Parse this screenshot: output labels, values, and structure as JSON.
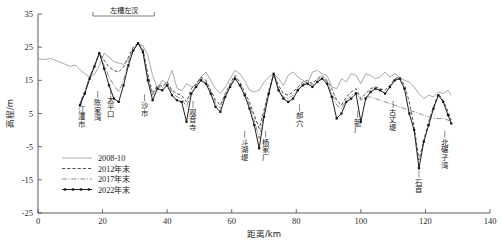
{
  "chart_data": {
    "type": "line",
    "title": "",
    "xlabel": "距离/km",
    "ylabel": "高程/m",
    "xlim": [
      0,
      140
    ],
    "ylim": [
      -25,
      35
    ],
    "xticks": [
      0,
      20,
      40,
      60,
      80,
      100,
      120,
      140
    ],
    "yticks": [
      -25,
      -15,
      -5,
      5,
      15,
      25,
      35
    ],
    "grid": false,
    "legend_position": "lower-left",
    "annotation": {
      "label": "左槽左汊",
      "x_start": 17,
      "x_end": 36
    },
    "site_labels": [
      {
        "name": "江澧市",
        "x": 13.5,
        "y": 8.0
      },
      {
        "name": "陈家湾",
        "x": 18.5,
        "y": 10.0
      },
      {
        "name": "太平口",
        "x": 22.5,
        "y": 11.0
      },
      {
        "name": "沙市",
        "x": 33.0,
        "y": 9.0
      },
      {
        "name": "观音寺",
        "x": 48.0,
        "y": 7.0
      },
      {
        "name": "斗湖堤",
        "x": 64.0,
        "y": -2.0
      },
      {
        "name": "杨家厂",
        "x": 70.5,
        "y": -2.0
      },
      {
        "name": "郝穴",
        "x": 81.0,
        "y": 6.0
      },
      {
        "name": "新厂",
        "x": 99.0,
        "y": 4.0
      },
      {
        "name": "古丈堤",
        "x": 110.0,
        "y": 7.0
      },
      {
        "name": "石首",
        "x": 118.0,
        "y": -14.0
      },
      {
        "name": "北碾子湾",
        "x": 126.0,
        "y": -2.0
      }
    ],
    "series": [
      {
        "name": "2008-10",
        "style": "solid-gray",
        "color": "#9a9a9a",
        "x": [
          0,
          2,
          4,
          6,
          8,
          10,
          11.5,
          13,
          14.5,
          16,
          17.5,
          19,
          20.5,
          22,
          23.5,
          25,
          26.5,
          28,
          29.5,
          31,
          32.5,
          34,
          35.5,
          37,
          38.5,
          40,
          41.5,
          43,
          44.5,
          46,
          47.5,
          49,
          50.5,
          52,
          53.5,
          55,
          56.5,
          58,
          59.5,
          61,
          62.5,
          64,
          65.5,
          67,
          68.5,
          70,
          71.5,
          73,
          74.5,
          76,
          77.5,
          79,
          80.5,
          82,
          83.5,
          85,
          86.5,
          88,
          89.5,
          91,
          92.5,
          94,
          95.5,
          97,
          98.5,
          100,
          101.5,
          103,
          104.5,
          106,
          107.5,
          109,
          110.5,
          112,
          113.5,
          115,
          116.5,
          118,
          119.5,
          121,
          122.5,
          124,
          125.5,
          127,
          128
        ],
        "values": [
          21.5,
          21.3,
          21.6,
          20.8,
          20.0,
          19.2,
          19.6,
          18.2,
          17.0,
          16.0,
          16.8,
          19.5,
          23.2,
          22.0,
          20.6,
          20.2,
          19.8,
          21.5,
          24.0,
          26.0,
          25.5,
          22.5,
          16.5,
          12.5,
          15.0,
          14.2,
          18.0,
          12.8,
          11.8,
          14.0,
          13.0,
          13.5,
          16.0,
          17.5,
          15.0,
          12.5,
          11.0,
          13.0,
          15.5,
          18.0,
          17.0,
          15.0,
          12.0,
          11.5,
          12.0,
          14.5,
          16.0,
          17.0,
          15.5,
          13.5,
          16.5,
          17.5,
          16.0,
          15.0,
          14.0,
          17.5,
          18.0,
          17.0,
          16.5,
          13.0,
          12.5,
          15.5,
          14.5,
          17.0,
          16.5,
          14.0,
          17.0,
          16.5,
          15.5,
          16.0,
          17.5,
          16.0,
          17.0,
          16.0,
          15.0,
          14.5,
          13.0,
          11.0,
          9.5,
          10.5,
          10.0,
          11.5,
          11.0,
          12.0,
          10.5
        ]
      },
      {
        "name": "2012年末",
        "style": "dashed",
        "color": "#333333",
        "x": [
          13,
          14.5,
          16,
          17.5,
          19,
          20.5,
          22,
          23.5,
          25,
          26.5,
          28,
          29.5,
          31,
          32.5,
          34,
          35.5,
          37,
          38.5,
          40,
          41.5,
          43,
          44.5,
          46,
          47.5,
          49,
          50.5,
          52,
          53.5,
          55,
          56.5,
          58,
          59.5,
          61,
          62.5,
          64,
          65.5,
          67,
          68.5,
          70,
          71.5,
          73,
          74.5,
          76,
          77.5,
          79,
          80.5,
          82,
          83.5,
          85,
          86.5,
          88,
          89.5,
          91,
          92.5,
          94,
          95.5,
          97,
          98.5,
          100,
          101.5,
          103,
          104.5,
          106,
          107.5,
          109,
          110.5,
          112,
          113.5,
          115,
          116.5,
          118,
          119.5,
          121,
          122.5,
          124,
          125.5,
          127,
          128
        ],
        "values": [
          8.0,
          11.5,
          16.0,
          19.5,
          23.3,
          21.0,
          19.0,
          18.0,
          17.5,
          19.0,
          22.0,
          25.0,
          26.2,
          24.5,
          17.0,
          11.0,
          13.5,
          13.2,
          14.5,
          12.0,
          11.0,
          10.5,
          8.5,
          12.5,
          14.0,
          16.0,
          15.0,
          12.0,
          9.0,
          7.5,
          11.0,
          14.0,
          16.5,
          14.5,
          11.5,
          8.5,
          4.5,
          0.5,
          6.0,
          12.0,
          17.0,
          13.5,
          11.0,
          10.5,
          11.5,
          13.0,
          14.5,
          15.0,
          14.0,
          15.5,
          16.5,
          15.0,
          12.5,
          9.0,
          7.5,
          10.0,
          11.5,
          12.5,
          9.5,
          11.0,
          12.5,
          13.0,
          12.5,
          12.0,
          13.5,
          15.5,
          16.0,
          13.5,
          8.5,
          1.0,
          -9.0,
          -3.0,
          2.5,
          7.0,
          11.0,
          9.0,
          5.5,
          3.0
        ]
      },
      {
        "name": "2017年末",
        "style": "dash-dot",
        "color": "#777777",
        "x": [
          13,
          14.5,
          16,
          17.5,
          19,
          20.5,
          22,
          23.5,
          25,
          26.5,
          28,
          29.5,
          31,
          32.5,
          34,
          35.5,
          37,
          38.5,
          40,
          41.5,
          43,
          44.5,
          46,
          47.5,
          49,
          50.5,
          52,
          53.5,
          55,
          56.5,
          58,
          59.5,
          61,
          62.5,
          64,
          65.5,
          67,
          68.5,
          70,
          71.5,
          73,
          74.5,
          76,
          77.5,
          79,
          80.5,
          82,
          83.5,
          85,
          86.5,
          88,
          89.5,
          91,
          92.5,
          94,
          95.5,
          97,
          98.5,
          100,
          101.5,
          103,
          104.5,
          106,
          107.5,
          109,
          110.5,
          112,
          113.5,
          115,
          116.5,
          118,
          119.5,
          121,
          122.5,
          124,
          125.5,
          127,
          128
        ],
        "values": [
          8.0,
          11.5,
          16.0,
          19.5,
          23.2,
          19.5,
          16.0,
          13.5,
          11.5,
          15.0,
          20.5,
          24.5,
          26.0,
          24.0,
          16.0,
          10.5,
          13.0,
          12.8,
          14.0,
          11.5,
          10.0,
          9.5,
          7.0,
          11.5,
          13.5,
          15.5,
          14.5,
          11.5,
          8.0,
          6.5,
          10.5,
          13.5,
          16.0,
          14.0,
          11.0,
          7.5,
          3.0,
          -2.5,
          5.0,
          11.5,
          17.0,
          12.5,
          10.0,
          9.5,
          10.5,
          12.5,
          14.0,
          14.5,
          13.5,
          15.0,
          16.0,
          14.5,
          11.0,
          7.5,
          6.5,
          9.0,
          10.5,
          11.5,
          9.0,
          10.0,
          10.0,
          9.5,
          9.0,
          8.5,
          8.0,
          7.5,
          7.0,
          6.5,
          6.0,
          5.5,
          5.0,
          4.5,
          4.0,
          3.5,
          3.5,
          3.5,
          3.0,
          2.5
        ]
      },
      {
        "name": "2022年末",
        "style": "solid-marker",
        "color": "#111111",
        "x": [
          13,
          14.5,
          16,
          17.5,
          19,
          20.5,
          22,
          23.5,
          25,
          26.5,
          28,
          29.5,
          31,
          32.5,
          34,
          35.5,
          37,
          38.5,
          40,
          41.5,
          43,
          44.5,
          46,
          47.5,
          49,
          50.5,
          52,
          53.5,
          55,
          56.5,
          58,
          59.5,
          61,
          62.5,
          64,
          65.5,
          67,
          68.5,
          70,
          71.5,
          73,
          74.5,
          76,
          77.5,
          79,
          80.5,
          82,
          83.5,
          85,
          86.5,
          88,
          89.5,
          91,
          92.5,
          94,
          95.5,
          97,
          98.5,
          100,
          101.5,
          103,
          104.5,
          106,
          107.5,
          109,
          110.5,
          112,
          113.5,
          115,
          116.5,
          118,
          119.5,
          121,
          122.5,
          124,
          125.5,
          127,
          128
        ],
        "values": [
          7.5,
          11.0,
          15.5,
          19.2,
          23.2,
          18.5,
          13.5,
          9.5,
          8.5,
          13.5,
          19.5,
          24.0,
          26.2,
          23.5,
          15.0,
          9.0,
          12.5,
          12.0,
          13.5,
          10.5,
          9.0,
          8.5,
          2.5,
          11.0,
          13.0,
          15.0,
          14.0,
          11.0,
          7.0,
          5.5,
          10.0,
          13.0,
          15.5,
          13.5,
          10.5,
          6.5,
          1.5,
          -5.5,
          4.0,
          11.0,
          17.0,
          12.0,
          9.5,
          8.5,
          9.5,
          12.0,
          13.5,
          14.0,
          13.0,
          14.5,
          15.5,
          14.0,
          10.0,
          3.5,
          5.0,
          8.5,
          9.5,
          11.0,
          2.5,
          9.5,
          11.5,
          12.5,
          12.0,
          11.0,
          13.0,
          15.0,
          15.5,
          12.5,
          5.0,
          0.0,
          -11.5,
          -3.5,
          1.5,
          6.5,
          10.5,
          8.5,
          4.5,
          2.0
        ]
      }
    ]
  },
  "legend": {
    "items": [
      {
        "label": "2008-10",
        "style": "solid-gray"
      },
      {
        "label": "2012年末",
        "style": "dashed"
      },
      {
        "label": "2017年末",
        "style": "dash-dot"
      },
      {
        "label": "2022年末",
        "style": "solid-marker"
      }
    ]
  }
}
